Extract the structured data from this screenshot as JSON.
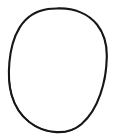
{
  "image": {
    "kind": "hand-drawn-sketch",
    "subject": "oval outline",
    "alt_text": "A hand-drawn closed oval, egg-like outline in black ink on a plain white background",
    "width_px": 116,
    "height_px": 139,
    "background_color": "#ffffff",
    "ink_color": "#17161a"
  },
  "shape": {
    "name": "oval-outline",
    "closed": true,
    "filled": false,
    "leftmost_x": 9,
    "rightmost_x": 107,
    "topmost_y": 8,
    "bottommost_y": 132,
    "center_x": 58,
    "center_y": 70,
    "stroke_width_min": 1.8,
    "stroke_width_max": 3.4,
    "path_main": "M 58.5 8.4 C 74.5 8.0 88.5 14.0 97.0 24.5 C 104.2 33.4 106.9 44.6 106.8 56.0 C 106.7 69.0 104.6 82.0 100.4 94.2 C 96.4 105.8 90.4 116.4 81.6 124.0 C 74.6 130.1 65.6 132.6 56.4 132.1 C 46.6 131.6 37.0 128.2 29.2 122.0 C 20.6 115.2 14.6 105.6 11.6 95.0 C 8.6 84.4 8.4 73.2 9.4 62.2 C 10.5 50.2 13.2 38.2 19.4 27.9 C 25.7 17.4 36.0 10.8 48.0 9.0 C 51.4 8.5 55.0 8.5 58.5 8.4 Z",
    "path_overdraw_bottom_left": "M 29.2 122.0 C 20.6 115.2 14.6 105.6 11.6 95.0 C 9.9 88.9 9.1 82.6 8.9 76.2",
    "path_overdraw_bottom": "M 32.5 124.4 C 40.0 129.4 48.6 132.1 57.4 132.2 C 66.0 132.3 74.4 129.9 81.0 124.7",
    "path_overdraw_right": "M 99.2 27.8 C 104.6 36.3 106.8 46.4 106.8 56.4 C 106.8 64.6 106.0 72.8 104.5 80.8"
  },
  "scene": {
    "object_count": 1,
    "text_present": false,
    "annotations": []
  }
}
